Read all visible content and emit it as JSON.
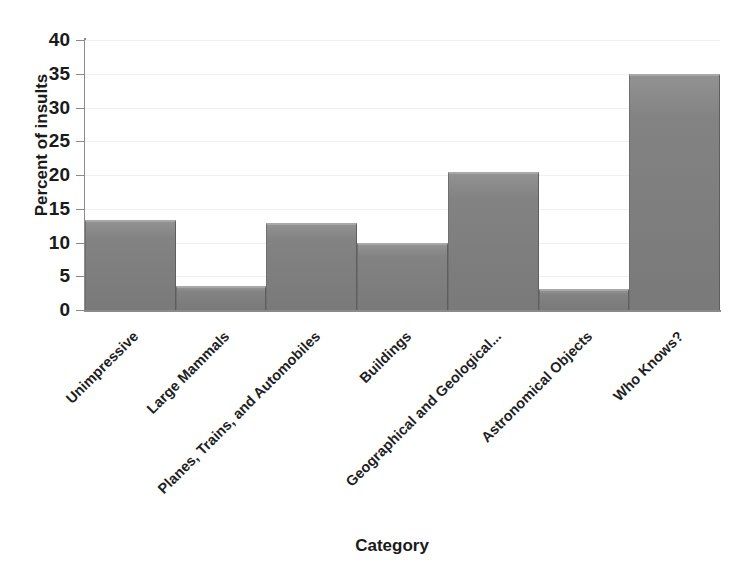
{
  "chart_data": {
    "type": "bar",
    "title": "",
    "xlabel": "Category",
    "ylabel": "Percent of insults",
    "categories": [
      "Unimpressive",
      "Large Mammals",
      "Planes, Trains, and Automobiles",
      "Buildings",
      "Geographical and Geological...",
      "Astronomical Objects",
      "Who Knows?"
    ],
    "values": [
      13.3,
      3.5,
      12.9,
      10.0,
      20.4,
      3.1,
      35.0
    ],
    "ylim": [
      0,
      40
    ],
    "yticks": [
      40,
      35,
      30,
      25,
      20,
      15,
      10,
      5,
      0
    ],
    "ytick_labels": [
      "40",
      "35",
      "30",
      "25",
      "20",
      "15",
      "10",
      "5",
      "0"
    ],
    "grid": true,
    "legend": false,
    "bar_color": "#808080",
    "bar_top_highlight": "#a8a8a8",
    "axis_color": "#8a8a8a",
    "gridline_color": "#f0f0f0",
    "text_color": "#1a1a1a",
    "background": "#ffffff"
  },
  "axes": {
    "y_title": "Percent of insults",
    "x_title": "Category"
  }
}
